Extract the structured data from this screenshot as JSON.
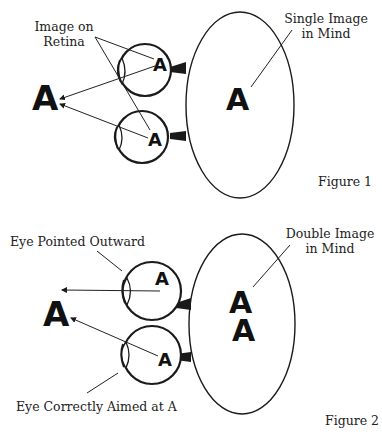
{
  "figure1": {
    "caption": "Figure 1",
    "label_retina_line1": "Image on",
    "label_retina_line2": "Retina",
    "label_mind_line1": "Single Image",
    "label_mind_line2": "in Mind",
    "object_letter": "A",
    "retina_letter_top": "A",
    "retina_letter_bottom": "A",
    "mind_letter": "A"
  },
  "figure2": {
    "caption": "Figure 2",
    "label_outward": "Eye Pointed Outward",
    "label_correct": "Eye Correctly Aimed at A",
    "label_mind_line1": "Double Image",
    "label_mind_line2": "in Mind",
    "object_letter": "A",
    "retina_letter_top": "A",
    "retina_letter_bottom": "A",
    "mind_letter_top": "A",
    "mind_letter_bottom": "A"
  },
  "colors": {
    "ink": "#1a1a1a",
    "background": "#ffffff"
  }
}
